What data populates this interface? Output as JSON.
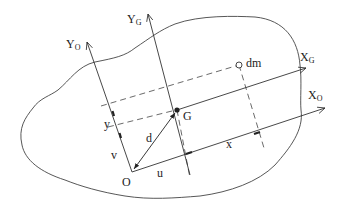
{
  "diagram": {
    "axes": {
      "y_origin": {
        "label": "Y",
        "sub": "O"
      },
      "y_centroid": {
        "label": "Y",
        "sub": "G"
      },
      "x_centroid": {
        "label": "X",
        "sub": "G"
      },
      "x_origin": {
        "label": "X",
        "sub": "O"
      }
    },
    "points": {
      "origin": "O",
      "centroid": "G",
      "mass_element": "dm"
    },
    "segments": {
      "u": "u",
      "v": "v",
      "d": "d",
      "x": "x",
      "y": "y"
    },
    "colors": {
      "stroke": "#333333",
      "background": "#ffffff"
    }
  }
}
